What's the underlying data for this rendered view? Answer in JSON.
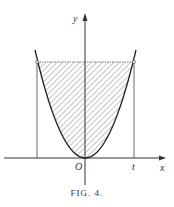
{
  "figure": {
    "caption": "FIG. 4.",
    "labels": {
      "y_axis": "y",
      "x_axis": "x",
      "origin": "O",
      "t_mark": "t"
    }
  }
}
